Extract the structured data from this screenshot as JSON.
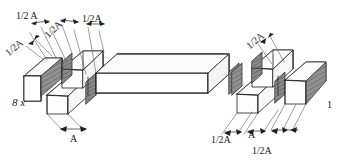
{
  "diagram": {
    "colors": {
      "line": "#2b2b2b",
      "shaded_face": "#8d8d8d",
      "light_face": "#fdfdfd",
      "mid_face": "#f2f2f2",
      "leader": "#555555",
      "background": "#ffffff"
    },
    "labels": {
      "left_top_a": "1/2 A",
      "left_top_b": "1/2A",
      "left_top_c": "1/2A",
      "left_side_a": "1/2A",
      "left_count": "8 x",
      "left_bottom_a": "A",
      "right_top_a": "1/2A",
      "right_count": "1",
      "right_bottom_a": "1/2A",
      "right_bottom_b": "A",
      "right_bottom_c": "1/2A"
    }
  }
}
